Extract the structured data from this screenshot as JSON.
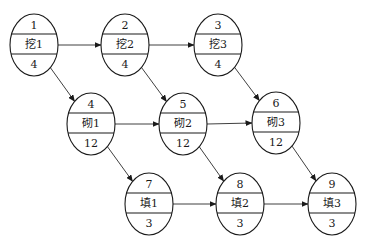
{
  "diagram": {
    "type": "activity-on-node network",
    "nodes": [
      {
        "id": "1",
        "number": "1",
        "name": "挖1",
        "duration": "4",
        "cx": 34,
        "cy": 45
      },
      {
        "id": "2",
        "number": "2",
        "name": "挖2",
        "duration": "4",
        "cx": 125,
        "cy": 45
      },
      {
        "id": "3",
        "number": "3",
        "name": "挖3",
        "duration": "4",
        "cx": 218,
        "cy": 45
      },
      {
        "id": "4",
        "number": "4",
        "name": "砌1",
        "duration": "12",
        "cx": 91,
        "cy": 124
      },
      {
        "id": "5",
        "number": "5",
        "name": "砌2",
        "duration": "12",
        "cx": 183,
        "cy": 124
      },
      {
        "id": "6",
        "number": "6",
        "name": "砌3",
        "duration": "12",
        "cx": 276,
        "cy": 123
      },
      {
        "id": "7",
        "number": "7",
        "name": "填1",
        "duration": "3",
        "cx": 149,
        "cy": 204
      },
      {
        "id": "8",
        "number": "8",
        "name": "填2",
        "duration": "3",
        "cx": 240,
        "cy": 204
      },
      {
        "id": "9",
        "number": "9",
        "name": "填3",
        "duration": "3",
        "cx": 332,
        "cy": 204
      }
    ],
    "edges": [
      {
        "from": "1",
        "to": "2"
      },
      {
        "from": "2",
        "to": "3"
      },
      {
        "from": "1",
        "to": "4"
      },
      {
        "from": "2",
        "to": "5"
      },
      {
        "from": "3",
        "to": "6"
      },
      {
        "from": "4",
        "to": "5"
      },
      {
        "from": "5",
        "to": "6"
      },
      {
        "from": "4",
        "to": "7"
      },
      {
        "from": "5",
        "to": "8"
      },
      {
        "from": "6",
        "to": "9"
      },
      {
        "from": "7",
        "to": "8"
      },
      {
        "from": "8",
        "to": "9"
      }
    ],
    "style": {
      "stroke": "#1a1a1a",
      "background": "#ffffff",
      "rx": 24,
      "ry": 31
    }
  }
}
